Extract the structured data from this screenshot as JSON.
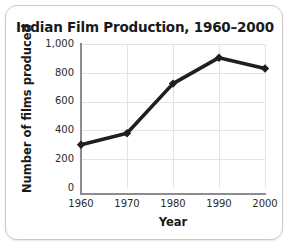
{
  "chart_data": {
    "type": "line",
    "title": "Indian Film Production, 1960–2000",
    "xlabel": "Year",
    "ylabel": "Number of films produced",
    "categories": [
      "1960",
      "1970",
      "1980",
      "1990",
      "2000"
    ],
    "x": [
      1960,
      1970,
      1980,
      1990,
      2000
    ],
    "values": [
      300,
      380,
      725,
      905,
      830
    ],
    "series": [
      {
        "name": "Number of films produced",
        "values": [
          300,
          380,
          725,
          905,
          830
        ]
      }
    ],
    "xlim": [
      1960,
      2000
    ],
    "ylim": [
      0,
      1000
    ],
    "ytick_labels": [
      "0",
      "200",
      "400",
      "600",
      "800",
      "1,000"
    ],
    "ytick_values": [
      0,
      200,
      400,
      600,
      800,
      1000
    ],
    "xtick_labels": [
      "1960",
      "1970",
      "1980",
      "1990",
      "2000"
    ],
    "grid": true,
    "legend": null,
    "line_color": "#1f1f1f",
    "marker": "diamond",
    "marker_color": "#1f1f1f",
    "grid_color": "#e3e3e3",
    "axis_color": "#8d8d8d",
    "text_color": "#1a1a1a",
    "background_color": "#ffffff",
    "border_color": "#c9c9c9"
  }
}
